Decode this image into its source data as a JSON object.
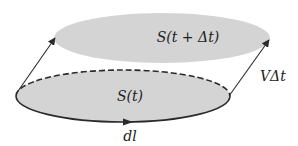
{
  "diagram": {
    "type": "moving-surface",
    "colors": {
      "surface_fill": "#d4d4d4",
      "stroke": "#2a2a2a",
      "background": "#ffffff"
    },
    "labels": {
      "surface_later": "S(t + Δt)",
      "surface_now": "S(t)",
      "displacement": "VΔt",
      "line_element": "dl"
    },
    "surfaces": [
      {
        "name": "S(t+Δt)",
        "cx": 162,
        "cy": 38,
        "rx": 108,
        "ry": 25
      },
      {
        "name": "S(t)",
        "cx": 123,
        "cy": 96,
        "rx": 107,
        "ry": 26,
        "upper_half": "dashed"
      }
    ],
    "arrows": [
      {
        "name": "left-displacement",
        "from": [
          16,
          94
        ],
        "to": [
          55,
          38
        ]
      },
      {
        "name": "right-displacement",
        "from": [
          229,
          96
        ],
        "to": [
          269,
          40
        ]
      },
      {
        "name": "boundary-direction",
        "at": [
          128,
          122
        ],
        "direction": "right"
      }
    ]
  }
}
